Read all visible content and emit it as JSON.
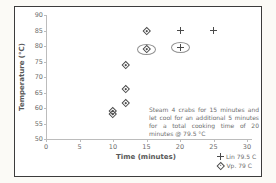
{
  "colors": {
    "page_background": "#fbfaf6",
    "plot_background": "#ffffff",
    "frame_border": "#3c3c3c",
    "axis": "#bcbcbc",
    "text": "#6e6e6e",
    "marker": "#4a4a4a",
    "highlight_ellipse": "#8f8f8f"
  },
  "chart_data": {
    "type": "scatter",
    "title": "",
    "xlabel": "Time (minutes)",
    "ylabel": "Temperature (°C)",
    "xlim": [
      0,
      30
    ],
    "ylim": [
      50,
      90
    ],
    "xticks": [
      0,
      5,
      10,
      15,
      20,
      25,
      30
    ],
    "yticks": [
      90,
      85,
      80,
      75,
      70,
      65,
      60,
      55,
      50
    ],
    "grid": false,
    "legend_position": "bottom-right-below-axis",
    "annotation": "Steam 4 crabs for 15 minutes and let cool for an additional 5 minutes for a total cooking time of 20 minutes @ 79.5 °C",
    "series": [
      {
        "name": "Lin 79.5 C",
        "marker": "plus",
        "color": "#4a4a4a",
        "points": [
          {
            "x": 20,
            "y": 85
          },
          {
            "x": 25,
            "y": 85
          },
          {
            "x": 20,
            "y": 79.5,
            "circled": true
          }
        ]
      },
      {
        "name": "Vp. 79 C",
        "marker": "diamond-dot",
        "color": "#4a4a4a",
        "points": [
          {
            "x": 15,
            "y": 85
          },
          {
            "x": 15,
            "y": 79,
            "circled": true
          },
          {
            "x": 12,
            "y": 74
          },
          {
            "x": 12,
            "y": 66
          },
          {
            "x": 12,
            "y": 61.5
          },
          {
            "x": 10,
            "y": 59
          },
          {
            "x": 10,
            "y": 58
          }
        ]
      }
    ]
  }
}
